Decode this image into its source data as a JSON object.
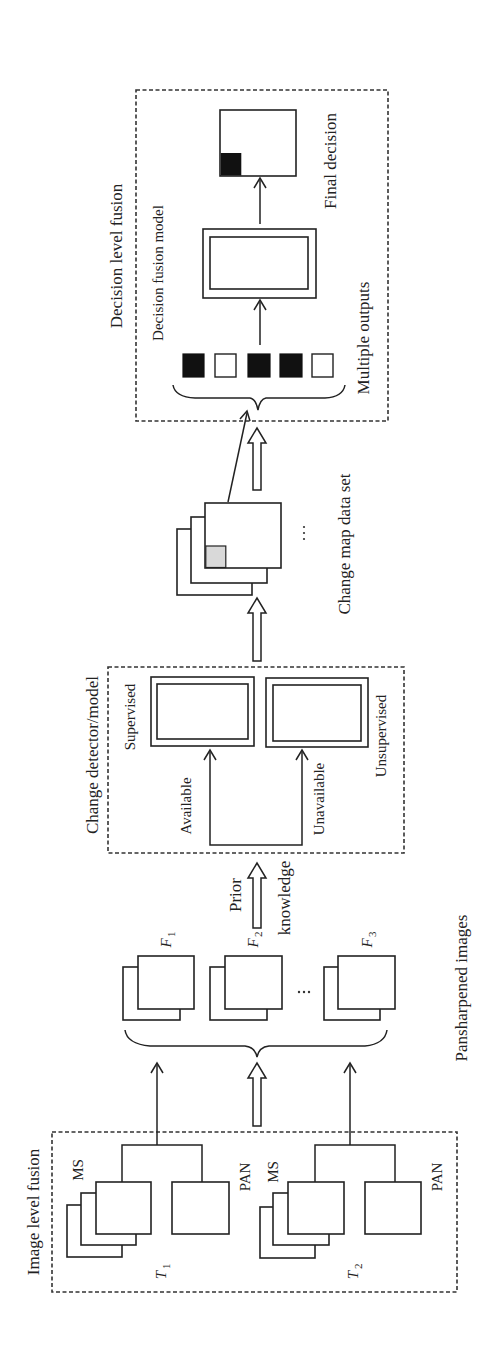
{
  "figure": {
    "orientation": "rotated 90° counter-clockwise",
    "sections": {
      "image_level": {
        "title": "Image level fusion",
        "groups": [
          {
            "time_label": "T",
            "time_sub": "1",
            "ms_label": "MS",
            "pan_label": "PAN"
          },
          {
            "time_label": "T",
            "time_sub": "2",
            "ms_label": "MS",
            "pan_label": "PAN"
          }
        ]
      },
      "pansharpened": {
        "title": "Pansharpened images",
        "images": [
          {
            "label": "F",
            "sub": "1"
          },
          {
            "label": "F",
            "sub": "2"
          },
          {
            "label": "F",
            "sub": "3"
          }
        ],
        "ellipsis": "..."
      },
      "prior_knowledge": {
        "line1": "Prior",
        "line2": "knowledge"
      },
      "change_detector": {
        "title": "Change detector/model",
        "branches": [
          {
            "condition": "Available",
            "model": "Supervised"
          },
          {
            "condition": "Unavailable",
            "model": "Unsupervised"
          }
        ]
      },
      "change_map": {
        "title": "Change map data set",
        "ellipsis": "..."
      },
      "decision_level": {
        "title": "Decision level fusion",
        "model_label": "Decision fusion model",
        "outputs_label": "Multiple outputs",
        "final_label": "Final decision",
        "outputs": [
          "black",
          "white",
          "black",
          "black",
          "white"
        ]
      }
    },
    "colors": {
      "stroke": "#222222",
      "fill_dark": "#111111",
      "fill_change": "#d9d9d9",
      "background": "#ffffff"
    }
  }
}
